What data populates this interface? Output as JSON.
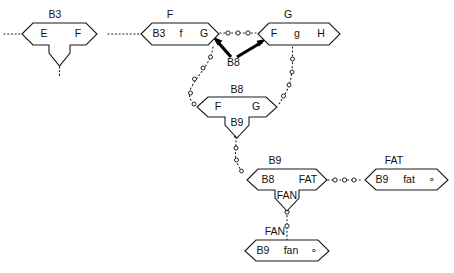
{
  "diagram": {
    "type": "node-link-diagram",
    "colors": {
      "background": "#ffffff",
      "stroke": "#1a1a1a",
      "text": "#111111",
      "arrow": "#000000",
      "ring_fill": "#ffffff"
    },
    "nodes": [
      {
        "id": "n-b3-left",
        "top_label": "B3",
        "cells": [
          "E",
          "F"
        ],
        "has_bottom_notch": true,
        "notch_label": "",
        "x": 22,
        "y": 23,
        "w": 75,
        "h": 22
      },
      {
        "id": "n-f-bcfg",
        "top_label": "F",
        "cells": [
          "B3",
          "f",
          "G"
        ],
        "has_bottom_notch": false,
        "notch_label": "",
        "x": 141,
        "y": 23,
        "w": 78,
        "h": 22
      },
      {
        "id": "n-g-fgh",
        "top_label": "G",
        "cells": [
          "F",
          "g",
          "H"
        ],
        "has_bottom_notch": false,
        "notch_label": "",
        "x": 258,
        "y": 23,
        "w": 82,
        "h": 22
      },
      {
        "id": "n-b8-mid",
        "top_label": "B8",
        "cells": [
          "F",
          "G"
        ],
        "has_bottom_notch": true,
        "notch_label": "B9",
        "x": 197,
        "y": 97,
        "w": 80,
        "h": 21
      },
      {
        "id": "n-b9-fat",
        "top_label": "B9",
        "cells": [
          "B8",
          "FAT"
        ],
        "has_bottom_notch": true,
        "notch_label": "FAN",
        "x": 247,
        "y": 169,
        "w": 79,
        "h": 21
      },
      {
        "id": "n-fat-right",
        "top_label": "FAT",
        "cells": [
          "B9",
          "fat",
          "∘"
        ],
        "has_bottom_notch": false,
        "notch_label": "",
        "x": 365,
        "y": 169,
        "w": 83,
        "h": 21
      },
      {
        "id": "n-fan-bottom",
        "top_label": "FAN",
        "cells": [
          "B9",
          "fan",
          "∘"
        ],
        "has_bottom_notch": false,
        "notch_label": "",
        "x": 245,
        "y": 240,
        "w": 84,
        "h": 21
      }
    ],
    "edges": [
      {
        "id": "e-left-stub",
        "kind": "dotted",
        "label": ""
      },
      {
        "id": "e-b3-to-f",
        "kind": "dotted",
        "label": ""
      },
      {
        "id": "e-f-to-g",
        "kind": "dotted-rings",
        "ring_count": 3,
        "label": ""
      },
      {
        "id": "e-b3-notch-down",
        "kind": "dotted",
        "label": ""
      },
      {
        "id": "e-b8-arrow-left",
        "kind": "arrow-thick",
        "label": "B8"
      },
      {
        "id": "e-b8-arrow-right",
        "kind": "arrow-thick",
        "label": "B8"
      },
      {
        "id": "e-gcell-down",
        "kind": "dotted-rings",
        "ring_count": 4,
        "label": ""
      },
      {
        "id": "e-fcell-down",
        "kind": "dotted-rings",
        "ring_count": 4,
        "label": ""
      },
      {
        "id": "e-b9-notch-down",
        "kind": "dotted-rings",
        "ring_count": 3,
        "label": ""
      },
      {
        "id": "e-fat-to-b9",
        "kind": "dotted-rings",
        "ring_count": 3,
        "label": ""
      },
      {
        "id": "e-fan-down",
        "kind": "dotted-rings",
        "ring_count": 2,
        "label": ""
      }
    ],
    "arrow_label": "B8"
  }
}
